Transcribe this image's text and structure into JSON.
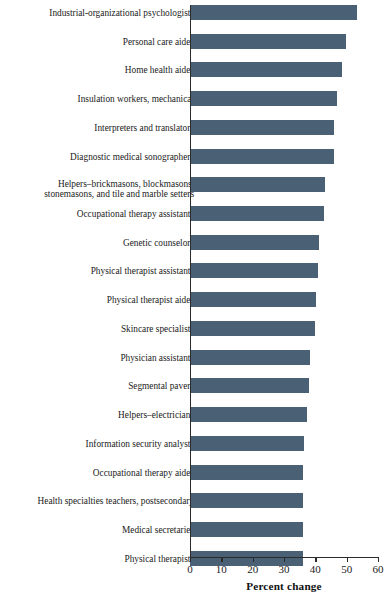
{
  "chart_data": {
    "type": "bar",
    "orientation": "horizontal",
    "title": "",
    "xlabel": "Percent change",
    "ylabel": "",
    "xlim": [
      0,
      60
    ],
    "xticks": [
      0,
      10,
      20,
      30,
      40,
      50,
      60
    ],
    "grid": false,
    "legend": null,
    "bar_color": "#4a6175",
    "categories": [
      "Industrial-organizational psychologists",
      "Personal care aides",
      "Home health aides",
      "Insulation workers, mechanical",
      "Interpreters and translators",
      "Diagnostic medical sonographers",
      "Helpers–brickmasons, blockmasons,\nstonemasons, and tile and marble setters",
      "Occupational therapy assistants",
      "Genetic counselors",
      "Physical therapist assistants",
      "Physical therapist aides",
      "Skincare specialists",
      "Physician assistants",
      "Segmental pavers",
      "Helpers–electricians",
      "Information security analysts",
      "Occupational therapy aides",
      "Health specialties teachers, postsecondary",
      "Medical secretaries",
      "Physical therapists"
    ],
    "values": [
      53.4,
      49.8,
      48.5,
      47.0,
      46.1,
      46.0,
      43.0,
      42.7,
      41.2,
      41.0,
      40.1,
      39.8,
      38.4,
      38.1,
      37.3,
      36.5,
      36.2,
      36.1,
      36.0,
      36.0
    ]
  }
}
